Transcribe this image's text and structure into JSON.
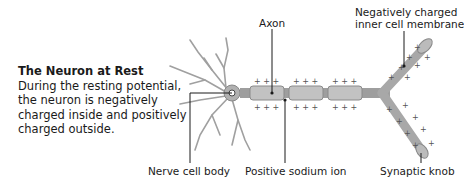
{
  "caption": {
    "title": "The Neuron at Rest",
    "body": "During the resting potential, the neuron is negatively charged inside and positively charged outside."
  },
  "labels": {
    "axon": "Axon",
    "membrane_line1": "Negatively charged",
    "membrane_line2": "inner cell membrane",
    "cell_body": "Nerve cell body",
    "sodium_ion": "Positive sodium ion",
    "synaptic_knob": "Synaptic knob"
  },
  "symbols": {
    "positive": "+",
    "negative": "−"
  },
  "colors": {
    "axon_fill": "#b5b5b5",
    "axon_stroke": "#8a8a8a",
    "dendrite": "#9a9a9a",
    "text": "#1a1a1a"
  }
}
